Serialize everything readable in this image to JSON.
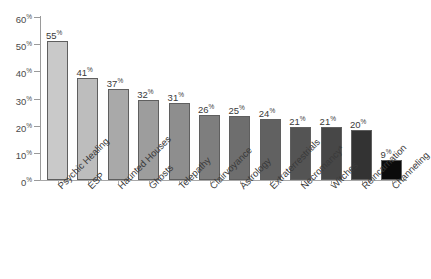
{
  "chart_data": {
    "type": "bar",
    "title": "",
    "subtitle": "",
    "xlabel": "",
    "ylabel": "",
    "ylim": [
      0,
      60
    ],
    "ytick_values": [
      60,
      50,
      40,
      30,
      20,
      10,
      0
    ],
    "ytick_labels": [
      "60%",
      "50%",
      "40%",
      "30%",
      "20%",
      "10%",
      "0%"
    ],
    "percent_symbol": "%",
    "grid": false,
    "legend": null,
    "categories": [
      "Psychic Healing",
      "ESP",
      "Haunted Houses",
      "Ghosts",
      "Telepathy",
      "Clairvoyance",
      "Astrology",
      "Extraterrestrials",
      "Necromancy*",
      "Witches",
      "Reincarnation",
      "Channeling"
    ],
    "values": [
      55,
      41,
      37,
      32,
      31,
      26,
      25,
      24,
      21,
      21,
      20,
      9
    ],
    "value_labels": [
      "55",
      "41",
      "37",
      "32",
      "31",
      "26",
      "25",
      "24",
      "21",
      "21",
      "20",
      "9"
    ],
    "bar_plot_heights": [
      51,
      37.5,
      33.5,
      29.5,
      28.5,
      24,
      23.5,
      22.5,
      19.5,
      19.5,
      18.5,
      7.5
    ],
    "bar_colors": [
      "#c9c9c9",
      "#bdbdbd",
      "#a9a9a9",
      "#9d9d9d",
      "#8e8e8e",
      "#7e7e7e",
      "#6e6e6e",
      "#616161",
      "#545454",
      "#474747",
      "#333333",
      "#0b0b0b"
    ],
    "bar_border_color": "#5f5f5f",
    "axis_color": "#9a9a9a",
    "text_color": "#3a3a3a",
    "background_color": "#ffffff"
  }
}
